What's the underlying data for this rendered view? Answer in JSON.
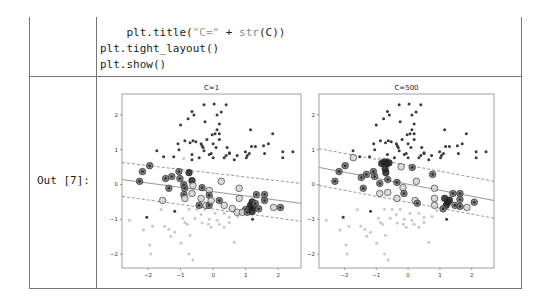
{
  "code_cell": {
    "lines": [
      {
        "indent": "    ",
        "prefix": "plt.title(",
        "string": "\"C=\"",
        "op": " + ",
        "fn": "str",
        "suffix": "(C))"
      },
      {
        "indent": "",
        "text": "plt.tight_layout()"
      },
      {
        "indent": "",
        "text": "plt.show()"
      }
    ]
  },
  "output": {
    "label": "Out [7]:"
  },
  "colors": {
    "class1": "#3a3a3a",
    "class0": "#c8c8c8",
    "sv_dark_fill": "#6e6e6e",
    "sv_light_fill": "#d4d4d4",
    "line": "#8a8a8a",
    "border": "#777777"
  },
  "chart_data": [
    {
      "type": "scatter",
      "title": "C=1",
      "xlabel": "",
      "ylabel": "",
      "xlim": [
        -2.8,
        2.7
      ],
      "ylim": [
        -2.4,
        2.6
      ],
      "xticks": [
        "-2",
        "-1",
        "0",
        "1",
        "2"
      ],
      "yticks": [
        "2",
        "1",
        "0",
        "-1",
        "-2"
      ],
      "grid": false,
      "decision_boundary": {
        "solid": [
          [
            -2.8,
            0.14
          ],
          [
            2.7,
            -0.54
          ]
        ],
        "margin_upper": [
          [
            -2.8,
            0.63
          ],
          [
            2.7,
            0.03
          ]
        ],
        "margin_lower": [
          [
            -2.8,
            -0.34
          ],
          [
            2.7,
            -1.06
          ]
        ]
      },
      "series": [
        {
          "name": "class 1",
          "points": [
            [
              -0.28,
              2.29
            ],
            [
              0.03,
              2.31
            ],
            [
              0.4,
              2.29
            ],
            [
              -0.65,
              2.1
            ],
            [
              -0.59,
              2.0
            ],
            [
              0.25,
              2.08
            ],
            [
              0.12,
              2.0
            ],
            [
              -0.77,
              1.89
            ],
            [
              -1.0,
              1.71
            ],
            [
              -0.25,
              1.8
            ],
            [
              0.19,
              1.74
            ],
            [
              1.15,
              1.57
            ],
            [
              1.83,
              1.46
            ],
            [
              0.12,
              1.57
            ],
            [
              0.06,
              1.46
            ],
            [
              0.19,
              1.46
            ],
            [
              -0.03,
              1.43
            ],
            [
              0.19,
              1.29
            ],
            [
              -0.19,
              1.29
            ],
            [
              -0.87,
              1.26
            ],
            [
              -0.62,
              1.26
            ],
            [
              -0.53,
              1.23
            ],
            [
              -0.71,
              1.2
            ],
            [
              -1.08,
              1.17
            ],
            [
              -0.37,
              1.17
            ],
            [
              0.0,
              1.17
            ],
            [
              1.7,
              1.17
            ],
            [
              1.55,
              1.11
            ],
            [
              -0.34,
              1.11
            ],
            [
              -0.31,
              1.06
            ],
            [
              0.09,
              1.06
            ],
            [
              1.18,
              1.09
            ],
            [
              1.3,
              1.09
            ],
            [
              0.43,
              1.06
            ],
            [
              -1.73,
              0.97
            ],
            [
              -1.05,
              1.0
            ],
            [
              -0.28,
              0.97
            ],
            [
              -0.06,
              0.89
            ],
            [
              0.5,
              0.91
            ],
            [
              0.99,
              0.94
            ],
            [
              1.11,
              0.89
            ],
            [
              1.58,
              0.89
            ],
            [
              2.14,
              0.94
            ],
            [
              2.45,
              0.94
            ],
            [
              2.14,
              0.77
            ],
            [
              -1.52,
              0.8
            ],
            [
              -1.21,
              0.8
            ],
            [
              -0.65,
              0.86
            ],
            [
              -0.65,
              0.71
            ],
            [
              -0.43,
              0.77
            ],
            [
              -0.12,
              0.86
            ],
            [
              0.0,
              0.77
            ],
            [
              0.34,
              0.77
            ],
            [
              0.4,
              0.83
            ],
            [
              0.5,
              0.89
            ],
            [
              0.65,
              0.71
            ],
            [
              0.74,
              0.83
            ],
            [
              1.05,
              0.83
            ],
            [
              1.02,
              0.77
            ],
            [
              -2.04,
              -0.94
            ],
            [
              -1.18,
              -0.77
            ],
            [
              1.21,
              -1.0
            ]
          ]
        },
        {
          "name": "class 0",
          "points": [
            [
              -2.57,
              -1.03
            ],
            [
              -2.14,
              -1.31
            ],
            [
              -1.86,
              -1.2
            ],
            [
              -1.49,
              -1.2
            ],
            [
              -1.36,
              -1.29
            ],
            [
              -1.18,
              -1.37
            ],
            [
              -1.3,
              -1.49
            ],
            [
              -1.95,
              -1.74
            ],
            [
              -1.92,
              -2.0
            ],
            [
              -0.99,
              -1.69
            ],
            [
              -0.71,
              -1.46
            ],
            [
              -0.74,
              -2.0
            ],
            [
              -0.62,
              -2.17
            ],
            [
              -0.93,
              -0.97
            ],
            [
              -0.87,
              -1.09
            ],
            [
              -0.8,
              -1.14
            ],
            [
              -0.56,
              -0.97
            ],
            [
              -0.34,
              -1.11
            ],
            [
              -0.12,
              -1.0
            ],
            [
              -0.15,
              -1.14
            ],
            [
              -0.06,
              -1.23
            ],
            [
              0.19,
              -1.14
            ],
            [
              0.12,
              -1.03
            ],
            [
              0.34,
              -1.23
            ],
            [
              0.5,
              -1.09
            ],
            [
              0.65,
              -1.66
            ],
            [
              0.5,
              -0.94
            ],
            [
              -0.37,
              -0.86
            ],
            [
              -0.74,
              -0.71
            ],
            [
              -0.5,
              -0.71
            ],
            [
              0.06,
              -0.83
            ],
            [
              0.34,
              -0.83
            ],
            [
              -1.9,
              0.6
            ],
            [
              -0.9,
              0.75
            ],
            [
              -1.6,
              -0.72
            ],
            [
              0.9,
              -0.75
            ],
            [
              -0.25,
              -0.72
            ],
            [
              0.75,
              -0.92
            ]
          ]
        },
        {
          "name": "support vectors",
          "points": [
            [
              -1.95,
              0.54,
              1
            ],
            [
              -2.17,
              0.37,
              1
            ],
            [
              -2.26,
              0.09,
              1
            ],
            [
              -1.36,
              -0.11,
              1
            ],
            [
              -1.55,
              -0.46,
              0
            ],
            [
              -1.46,
              0.17,
              1
            ],
            [
              -1.27,
              0.23,
              1
            ],
            [
              -1.05,
              0.37,
              1
            ],
            [
              -1.02,
              0.17,
              1
            ],
            [
              -0.9,
              0.0,
              1
            ],
            [
              -0.87,
              -0.11,
              1
            ],
            [
              -0.9,
              -0.29,
              1
            ],
            [
              -0.87,
              -0.4,
              0
            ],
            [
              -0.74,
              0.34,
              2
            ],
            [
              -0.65,
              0.11,
              2
            ],
            [
              -0.62,
              -0.03,
              0
            ],
            [
              -0.65,
              -0.26,
              0
            ],
            [
              -0.34,
              -0.09,
              1
            ],
            [
              -0.37,
              -0.4,
              0
            ],
            [
              -0.43,
              -0.6,
              1
            ],
            [
              -0.22,
              -0.6,
              0
            ],
            [
              -0.12,
              -0.6,
              1
            ],
            [
              -0.12,
              -0.17,
              0
            ],
            [
              -0.12,
              -0.31,
              1
            ],
            [
              -0.06,
              -0.46,
              0
            ],
            [
              0.25,
              0.09,
              0
            ],
            [
              0.19,
              -0.46,
              1
            ],
            [
              0.34,
              -0.6,
              0
            ],
            [
              0.8,
              -0.11,
              0
            ],
            [
              0.8,
              -0.4,
              0
            ],
            [
              1.33,
              -0.29,
              1
            ],
            [
              1.58,
              -0.29,
              1
            ],
            [
              1.58,
              -0.46,
              1
            ],
            [
              2.07,
              -0.66,
              1
            ],
            [
              1.86,
              -0.66,
              0
            ],
            [
              1.15,
              -0.6,
              2
            ],
            [
              1.2,
              -0.5,
              2
            ],
            [
              1.1,
              -0.7,
              2
            ],
            [
              1.25,
              -0.65,
              2
            ],
            [
              1.3,
              -0.55,
              1
            ],
            [
              1.0,
              -0.72,
              1
            ],
            [
              0.59,
              -0.69,
              0
            ],
            [
              0.74,
              -0.8,
              0
            ],
            [
              0.9,
              -0.8,
              0
            ],
            [
              1.05,
              -0.8,
              1
            ],
            [
              1.4,
              -0.7,
              1
            ],
            [
              1.2,
              -0.78,
              2
            ]
          ]
        }
      ]
    },
    {
      "type": "scatter",
      "title": "C=500",
      "xlabel": "",
      "ylabel": "",
      "xlim": [
        -2.8,
        2.7
      ],
      "ylim": [
        -2.4,
        2.6
      ],
      "xticks": [
        "-2",
        "-1",
        "0",
        "1",
        "2"
      ],
      "yticks": [
        "2",
        "1",
        "0",
        "-1",
        "-2"
      ],
      "grid": false,
      "decision_boundary": {
        "solid": [
          [
            -2.8,
            0.49
          ],
          [
            2.7,
            -0.46
          ]
        ],
        "margin_upper": [
          [
            -2.8,
            1.03
          ],
          [
            2.7,
            0.09
          ]
        ],
        "margin_lower": [
          [
            -2.8,
            -0.03
          ],
          [
            2.7,
            -0.97
          ]
        ]
      },
      "series": [
        {
          "name": "class 1",
          "points": "same as C=1"
        },
        {
          "name": "class 0",
          "points": "same as C=1"
        },
        {
          "name": "support vectors",
          "points": [
            [
              -1.72,
              0.77,
              0
            ],
            [
              -1.98,
              0.54,
              1
            ],
            [
              -2.17,
              0.37,
              1
            ],
            [
              -2.3,
              0.09,
              1
            ],
            [
              -1.41,
              -0.11,
              1
            ],
            [
              -1.47,
              0.2,
              1
            ],
            [
              -1.31,
              0.29,
              1
            ],
            [
              -1.09,
              0.37,
              1
            ],
            [
              -1.05,
              0.23,
              1
            ],
            [
              -0.89,
              0.03,
              1
            ],
            [
              -0.89,
              -0.26,
              0
            ],
            [
              -0.83,
              0.6,
              2
            ],
            [
              -0.67,
              0.6,
              2
            ],
            [
              -0.75,
              0.65,
              2
            ],
            [
              -0.6,
              0.62,
              2
            ],
            [
              -0.7,
              0.34,
              2
            ],
            [
              -0.72,
              0.45,
              2
            ],
            [
              -0.64,
              0.14,
              1
            ],
            [
              -0.64,
              -0.23,
              0
            ],
            [
              -0.35,
              0.06,
              1
            ],
            [
              -0.22,
              0.51,
              0
            ],
            [
              -0.16,
              -0.09,
              0
            ],
            [
              -0.13,
              -0.26,
              1
            ],
            [
              -0.35,
              -0.4,
              0
            ],
            [
              0.13,
              0.49,
              1
            ],
            [
              0.26,
              0.09,
              0
            ],
            [
              0.22,
              -0.46,
              0
            ],
            [
              0.29,
              -0.54,
              1
            ],
            [
              0.77,
              0.29,
              1
            ],
            [
              0.83,
              -0.11,
              0
            ],
            [
              0.83,
              -0.4,
              0
            ],
            [
              0.83,
              -0.6,
              0
            ],
            [
              1.41,
              -0.26,
              1
            ],
            [
              1.63,
              -0.26,
              1
            ],
            [
              1.63,
              -0.43,
              1
            ],
            [
              2.08,
              -0.51,
              1
            ],
            [
              1.85,
              -0.66,
              0
            ],
            [
              1.25,
              -0.51,
              2
            ],
            [
              1.2,
              -0.6,
              2
            ],
            [
              1.3,
              -0.45,
              2
            ],
            [
              1.15,
              -0.4,
              2
            ],
            [
              1.47,
              -0.6,
              1
            ],
            [
              1.63,
              -0.63,
              1
            ],
            [
              1.1,
              -0.7,
              1
            ]
          ]
        }
      ]
    }
  ]
}
